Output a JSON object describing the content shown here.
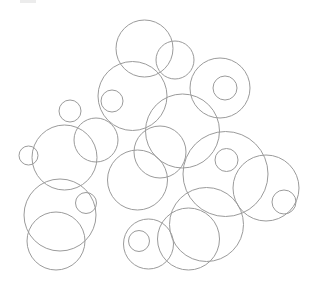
{
  "figure": {
    "background_color": "#ffffff",
    "stroke_color": "#9b9b9b",
    "stroke_width": 1,
    "width": 310,
    "height": 294,
    "corner_mark_color": "#ececec",
    "circle_count": 24
  },
  "chart_data": {
    "type": "scatter",
    "subtitle": "",
    "xlabel": "",
    "ylabel": "",
    "xlim": [
      0,
      310
    ],
    "ylim": [
      0,
      294
    ],
    "grid": false,
    "legend": null,
    "marker": "open-circle",
    "stroke_color": "#9b9b9b",
    "stroke_width": 1,
    "fill": "none",
    "annotations": [],
    "circles": [
      {
        "id": "c01",
        "cx": 144.5,
        "cy": 48.5,
        "r": 28.5
      },
      {
        "id": "c02",
        "cx": 175.0,
        "cy": 60.0,
        "r": 19.0
      },
      {
        "id": "c03",
        "cx": 220.0,
        "cy": 88.0,
        "r": 30.0
      },
      {
        "id": "c04",
        "cx": 225.0,
        "cy": 88.0,
        "r": 12.0
      },
      {
        "id": "c05",
        "cx": 132.5,
        "cy": 96.0,
        "r": 34.5
      },
      {
        "id": "c06",
        "cx": 112.0,
        "cy": 101.0,
        "r": 11.0
      },
      {
        "id": "c07",
        "cx": 182.5,
        "cy": 131.0,
        "r": 37.0
      },
      {
        "id": "c08",
        "cx": 70.0,
        "cy": 111.0,
        "r": 11.0
      },
      {
        "id": "c09",
        "cx": 64.5,
        "cy": 157.5,
        "r": 32.5
      },
      {
        "id": "c10",
        "cx": 28.5,
        "cy": 155.5,
        "r": 9.5
      },
      {
        "id": "c11",
        "cx": 137.5,
        "cy": 180.0,
        "r": 30.0
      },
      {
        "id": "c12",
        "cx": 225.5,
        "cy": 174.0,
        "r": 42.5
      },
      {
        "id": "c13",
        "cx": 226.5,
        "cy": 160.0,
        "r": 11.5
      },
      {
        "id": "c14",
        "cx": 266.0,
        "cy": 188.0,
        "r": 33.0
      },
      {
        "id": "c15",
        "cx": 284.0,
        "cy": 202.0,
        "r": 12.0
      },
      {
        "id": "c16",
        "cx": 60.0,
        "cy": 215.0,
        "r": 36.0
      },
      {
        "id": "c17",
        "cx": 56.0,
        "cy": 241.0,
        "r": 29.0
      },
      {
        "id": "c18",
        "cx": 86.0,
        "cy": 203.0,
        "r": 10.5
      },
      {
        "id": "c19",
        "cx": 148.5,
        "cy": 244.0,
        "r": 25.0
      },
      {
        "id": "c20",
        "cx": 139.0,
        "cy": 241.0,
        "r": 10.5
      },
      {
        "id": "c21",
        "cx": 188.5,
        "cy": 239.0,
        "r": 31.0
      },
      {
        "id": "c22",
        "cx": 206.5,
        "cy": 224.5,
        "r": 37.0
      },
      {
        "id": "c23",
        "cx": 160.0,
        "cy": 152.0,
        "r": 26.0
      },
      {
        "id": "c24",
        "cx": 96.0,
        "cy": 140.0,
        "r": 22.0
      }
    ]
  }
}
